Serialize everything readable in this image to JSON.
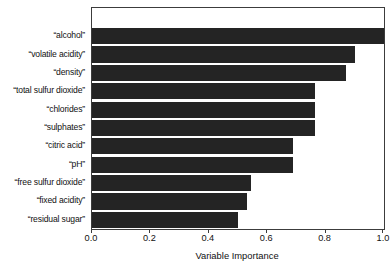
{
  "chart_data": {
    "type": "bar",
    "orientation": "horizontal",
    "title": "",
    "xlabel": "Variable Importance",
    "ylabel": "",
    "xlim": [
      0.0,
      1.0
    ],
    "ylim": null,
    "grid": false,
    "legend": null,
    "bar_color": "#242424",
    "frame_color": "#3c3c3c",
    "background": "#ffffff",
    "xticks": [
      0.0,
      0.2,
      0.4,
      0.6,
      0.8,
      1.0
    ],
    "xtick_labels": [
      "0.0",
      "0.2",
      "0.4",
      "0.6",
      "0.8",
      "1.0"
    ],
    "categories": [
      "“alcohol”",
      "“volatile acidity”",
      "“density”",
      "“total sulfur dioxide”",
      "“chlorides”",
      "“sulphates”",
      "“citric acid”",
      "“pH”",
      "“free sulfur dioxide”",
      "“fixed acidity”",
      "“residual sugar”"
    ],
    "values": [
      1.0,
      0.9,
      0.87,
      0.765,
      0.765,
      0.765,
      0.69,
      0.69,
      0.545,
      0.53,
      0.5
    ]
  }
}
